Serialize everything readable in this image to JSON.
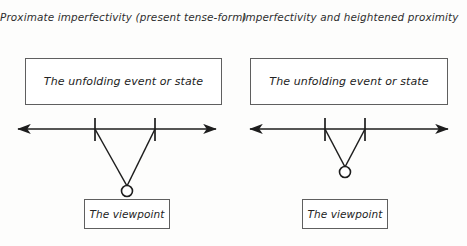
{
  "figure": {
    "background_color": "#fdfdfc",
    "line_color": "#1d1d1d",
    "box_border_color": "#5f5f5f",
    "text_color": "#232323"
  },
  "panels": [
    {
      "id": "left",
      "title": "Proximate imperfectivity (present tense-form)",
      "event_box_label": "The unfolding event or state",
      "viewpoint_box_label": "The viewpoint",
      "event_box": {
        "x": 25,
        "y": 58,
        "width": 197,
        "height": 47
      },
      "viewpoint_box": {
        "x": 84,
        "y": 199,
        "width": 86,
        "height": 30
      },
      "timeline": {
        "y": 129,
        "x_start": 18,
        "x_end": 216,
        "arrow_both_ends": true,
        "ticks": [
          {
            "x": 95,
            "y_top": 118,
            "y_bottom": 141
          },
          {
            "x": 155,
            "y_top": 118,
            "y_bottom": 141
          }
        ]
      },
      "viewpoint_circle": {
        "cx": 127,
        "cy": 191,
        "r": 5.5
      },
      "sight_lines": [
        {
          "x1": 95,
          "y1": 129,
          "x2": 127,
          "y2": 186
        },
        {
          "x1": 155,
          "y1": 129,
          "x2": 127,
          "y2": 186
        }
      ]
    },
    {
      "id": "right",
      "title": "Imperfectivity and heightened proximity",
      "event_box_label": "The unfolding event or state",
      "viewpoint_box_label": "The viewpoint",
      "event_box": {
        "x": 16,
        "y": 58,
        "width": 198,
        "height": 47
      },
      "viewpoint_box": {
        "x": 68,
        "y": 199,
        "width": 86,
        "height": 30
      },
      "timeline": {
        "y": 129,
        "x_start": 16,
        "x_end": 214,
        "arrow_both_ends": true,
        "ticks": [
          {
            "x": 91,
            "y_top": 118,
            "y_bottom": 141
          },
          {
            "x": 131,
            "y_top": 118,
            "y_bottom": 141
          }
        ]
      },
      "viewpoint_circle": {
        "cx": 111,
        "cy": 172,
        "r": 5.5
      },
      "sight_lines": [
        {
          "x1": 91,
          "y1": 129,
          "x2": 111,
          "y2": 167
        },
        {
          "x1": 131,
          "y1": 129,
          "x2": 111,
          "y2": 167
        }
      ]
    }
  ]
}
